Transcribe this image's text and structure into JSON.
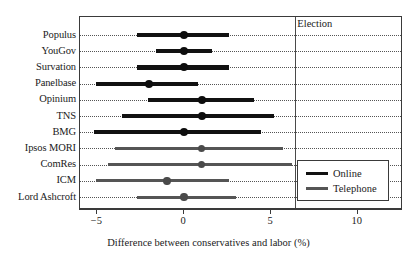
{
  "chart_data": {
    "type": "bar",
    "subtype": "dot-plot-with-confidence-intervals",
    "title": "",
    "xlabel": "Difference between conservatives and labor (%)",
    "ylabel": "",
    "xlim": [
      -6,
      12.6
    ],
    "xticks": [
      -5,
      0,
      5,
      10
    ],
    "xticklabels": [
      "−5",
      "0",
      "5",
      "10"
    ],
    "grid": "horizontal-dotted",
    "legend": {
      "position": "bottom-right",
      "entries": [
        {
          "label": "Online",
          "mode": "online",
          "color": "#111111"
        },
        {
          "label": "Telephone",
          "mode": "telephone",
          "color": "#555555"
        }
      ]
    },
    "annotations": [
      {
        "name": "election-line",
        "label": "Election",
        "x": 6.4,
        "orientation": "vertical"
      }
    ],
    "categories": [
      "Populus",
      "YouGov",
      "Survation",
      "Panelbase",
      "Opinium",
      "TNS",
      "BMG",
      "Ipsos MORI",
      "ComRes",
      "ICM",
      "Lord Ashcroft"
    ],
    "series": [
      {
        "name": "Online",
        "color": "#111111",
        "points": [
          {
            "category": "Populus",
            "estimate": 0.0,
            "low": -2.7,
            "high": 2.6
          },
          {
            "category": "YouGov",
            "estimate": 0.0,
            "low": -1.6,
            "high": 1.6
          },
          {
            "category": "Survation",
            "estimate": 0.0,
            "low": -2.7,
            "high": 2.6
          },
          {
            "category": "Panelbase",
            "estimate": -2.0,
            "low": -5.1,
            "high": 0.8
          },
          {
            "category": "Opinium",
            "estimate": 1.0,
            "low": -2.1,
            "high": 4.0
          },
          {
            "category": "TNS",
            "estimate": 1.0,
            "low": -3.6,
            "high": 5.2
          },
          {
            "category": "BMG",
            "estimate": 0.0,
            "low": -5.2,
            "high": 4.4
          }
        ]
      },
      {
        "name": "Telephone",
        "color": "#555555",
        "points": [
          {
            "category": "Ipsos MORI",
            "estimate": 1.0,
            "low": -4.0,
            "high": 5.7
          },
          {
            "category": "ComRes",
            "estimate": 1.0,
            "low": -4.4,
            "high": 6.2
          },
          {
            "category": "ICM",
            "estimate": -1.0,
            "low": -5.1,
            "high": 2.6
          },
          {
            "category": "Lord Ashcroft",
            "estimate": 0.0,
            "low": -2.7,
            "high": 3.0
          }
        ]
      }
    ]
  }
}
